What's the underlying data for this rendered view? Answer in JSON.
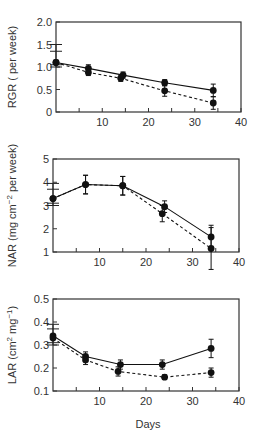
{
  "chart_data": [
    {
      "type": "line",
      "title": "",
      "xlabel": "",
      "ylabel": "RGR ( per week)",
      "xlim": [
        0,
        40
      ],
      "ylim": [
        0,
        2.0
      ],
      "xticks": [
        10,
        20,
        30,
        40
      ],
      "yticks": [
        0,
        0.5,
        1.0,
        1.5,
        2.0
      ],
      "ytick_labels": [
        "0",
        "0.5",
        "1.0",
        "1.5",
        "2.0"
      ],
      "grid": false,
      "series": [
        {
          "name": "solid",
          "style": "solid",
          "x": [
            0,
            7,
            14.5,
            23.5,
            34
          ],
          "y": [
            1.1,
            0.97,
            0.82,
            0.65,
            0.48
          ],
          "err": [
            0.0,
            0.08,
            0.07,
            0.07,
            0.14
          ]
        },
        {
          "name": "dashed",
          "style": "dashed",
          "x": [
            0,
            7,
            14,
            23.5,
            34
          ],
          "y": [
            1.1,
            0.88,
            0.75,
            0.47,
            0.2
          ],
          "err": [
            0.0,
            0.07,
            0.07,
            0.12,
            0.14
          ]
        }
      ],
      "left_error_bar": {
        "x": 0,
        "ticks": [
          1.0,
          1.05,
          1.35,
          1.5
        ]
      }
    },
    {
      "type": "line",
      "title": "",
      "xlabel": "",
      "ylabel": "NAR (mg cm⁻² per week)",
      "xlim": [
        0,
        40
      ],
      "ylim": [
        1,
        5
      ],
      "xticks": [
        10,
        20,
        30,
        40
      ],
      "yticks": [
        1,
        2,
        3,
        4,
        5
      ],
      "ytick_labels": [
        "1",
        "2",
        "3",
        "4",
        "5"
      ],
      "grid": false,
      "series": [
        {
          "name": "solid",
          "style": "solid",
          "x": [
            0,
            7,
            15,
            24,
            34
          ],
          "y": [
            3.3,
            3.9,
            3.85,
            2.95,
            1.65
          ],
          "err": [
            0.0,
            0.4,
            0.4,
            0.25,
            0.5
          ]
        },
        {
          "name": "dashed",
          "style": "dashed",
          "x": [
            0,
            7,
            15,
            23.5,
            34
          ],
          "y": [
            3.3,
            3.9,
            3.85,
            2.65,
            1.15
          ],
          "err": [
            0.0,
            0.4,
            0.4,
            0.35,
            0.9
          ]
        }
      ],
      "left_error_bar": {
        "x": 0,
        "ticks": [
          3.0,
          3.1,
          3.7,
          3.95
        ]
      }
    },
    {
      "type": "line",
      "title": "",
      "xlabel": "Days",
      "ylabel": "LAR (cm² mg⁻¹)",
      "xlim": [
        0,
        40
      ],
      "ylim": [
        0.1,
        0.5
      ],
      "xticks": [
        10,
        20,
        30,
        40
      ],
      "yticks": [
        0.1,
        0.2,
        0.3,
        0.4,
        0.5
      ],
      "ytick_labels": [
        "0.1",
        "0.2",
        "0.3",
        "0.4",
        "0.5"
      ],
      "grid": false,
      "series": [
        {
          "name": "solid",
          "style": "solid",
          "x": [
            0,
            7,
            14.5,
            23.5,
            34
          ],
          "y": [
            0.34,
            0.25,
            0.215,
            0.215,
            0.285
          ],
          "err": [
            0.0,
            0.02,
            0.02,
            0.02,
            0.04
          ]
        },
        {
          "name": "dashed",
          "style": "dashed",
          "x": [
            0,
            7,
            14,
            24,
            34
          ],
          "y": [
            0.33,
            0.235,
            0.185,
            0.16,
            0.18
          ],
          "err": [
            0.0,
            0.02,
            0.02,
            0.01,
            0.02
          ]
        }
      ],
      "left_error_bar": {
        "x": 0,
        "ticks": [
          0.3,
          0.31,
          0.37,
          0.39
        ]
      }
    }
  ],
  "x_axis_title": "Days"
}
